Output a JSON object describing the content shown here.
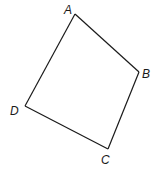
{
  "diagram": {
    "type": "quadrilateral",
    "stroke_color": "#1a1a1a",
    "background": "#ffffff",
    "vertices": [
      {
        "label": "A",
        "x": 75,
        "y": 14,
        "label_x": 64,
        "label_y": 14
      },
      {
        "label": "B",
        "x": 139,
        "y": 72,
        "label_x": 142,
        "label_y": 78
      },
      {
        "label": "C",
        "x": 108,
        "y": 149,
        "label_x": 101,
        "label_y": 164
      },
      {
        "label": "D",
        "x": 25,
        "y": 106,
        "label_x": 10,
        "label_y": 115
      }
    ],
    "edges": [
      {
        "from": "A",
        "to": "B"
      },
      {
        "from": "B",
        "to": "C"
      },
      {
        "from": "C",
        "to": "D"
      },
      {
        "from": "D",
        "to": "A"
      }
    ]
  }
}
